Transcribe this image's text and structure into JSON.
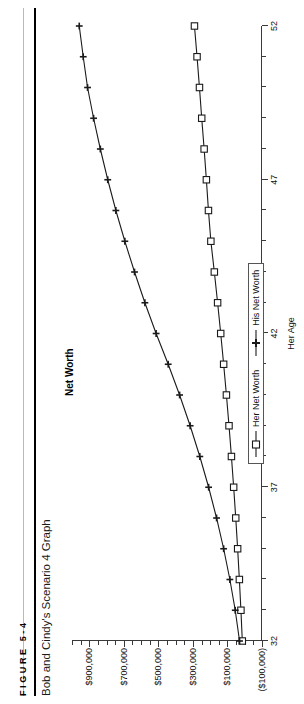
{
  "figure": {
    "label": "FIGURE 5-4",
    "caption": "Bob and Cindy's Scenario 4 Graph"
  },
  "chart_data": {
    "type": "line",
    "title": "Net Worth",
    "xlabel": "Her Age",
    "ylabel": "",
    "xlim": [
      32,
      52
    ],
    "ylim": [
      -100000,
      1000000
    ],
    "xticks": [
      32,
      37,
      42,
      47,
      52
    ],
    "xtick_labels": [
      "32",
      "37",
      "42",
      "47",
      "52"
    ],
    "yticks": [
      -100000,
      100000,
      300000,
      500000,
      700000,
      900000
    ],
    "ytick_labels": [
      "($100,000)",
      "$100,000",
      "$300,000",
      "$500,000",
      "$700,000",
      "$900,000"
    ],
    "grid": false,
    "legend_position": "bottom-center",
    "x": [
      32,
      33,
      34,
      35,
      36,
      37,
      38,
      39,
      40,
      41,
      42,
      43,
      44,
      45,
      46,
      47,
      48,
      49,
      50,
      51,
      52
    ],
    "series": [
      {
        "name": "Her Net Worth",
        "marker": "square",
        "color": "#1a1a1a",
        "values": [
          14000,
          22000,
          31000,
          41000,
          52000,
          64000,
          77000,
          91000,
          106000,
          122000,
          139000,
          157000,
          176000,
          196000,
          210000,
          222000,
          235000,
          249000,
          262000,
          276000,
          291000
        ]
      },
      {
        "name": "His Net Worth",
        "marker": "plus",
        "color": "#1a1a1a",
        "values": [
          30000,
          55000,
          86000,
          122000,
          163000,
          209000,
          260000,
          316000,
          377000,
          443000,
          513000,
          578000,
          638000,
          694000,
          746000,
          793000,
          836000,
          875000,
          910000,
          935000,
          958000
        ]
      }
    ],
    "legend": [
      {
        "label": "Her Net Worth",
        "marker": "square"
      },
      {
        "label": "His Net Worth",
        "marker": "plus"
      }
    ]
  }
}
